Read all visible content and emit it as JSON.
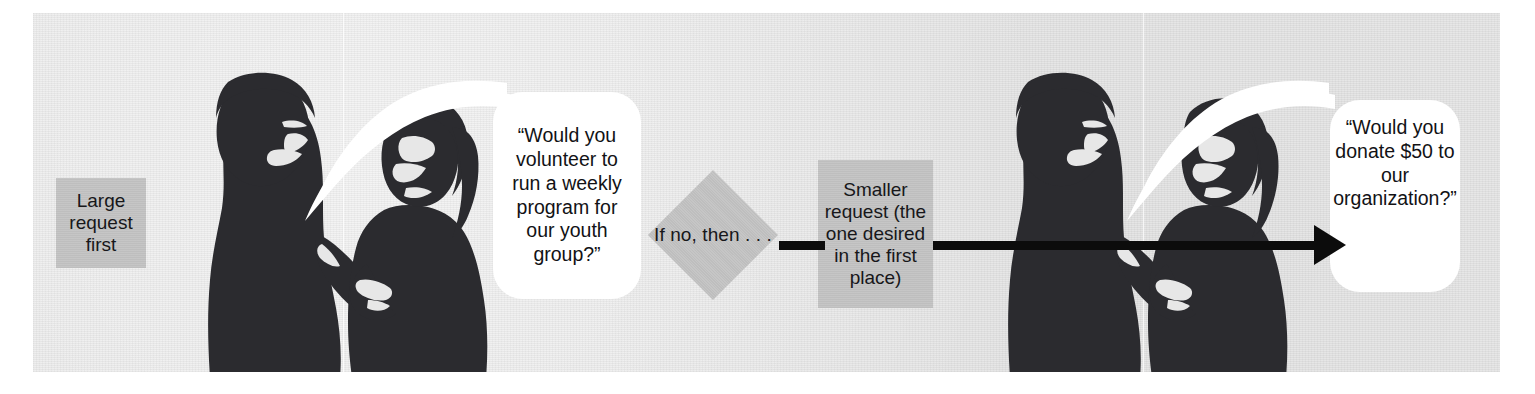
{
  "figure": {
    "background_color": "#e7e7e7",
    "box_color": "#c4c4c4",
    "balloon_color": "#ffffff",
    "ink_color": "#0c0c0c"
  },
  "steps": {
    "large_request": "Large request first",
    "decision": "If no, then . . .",
    "smaller_request": "Smaller request (the one desired in the first place)"
  },
  "speech": {
    "first": "“Would you volunteer to run a weekly program for our youth group?”",
    "second": "“Would you donate $50 to our organization?”"
  },
  "scenes": [
    {
      "name": "first-exchange",
      "speaker": "man",
      "listener": "woman"
    },
    {
      "name": "second-exchange",
      "speaker": "man",
      "listener": "woman"
    }
  ],
  "connectors": {
    "short": "decision-to-smaller-request",
    "long": "smaller-request-to-second-speech"
  }
}
